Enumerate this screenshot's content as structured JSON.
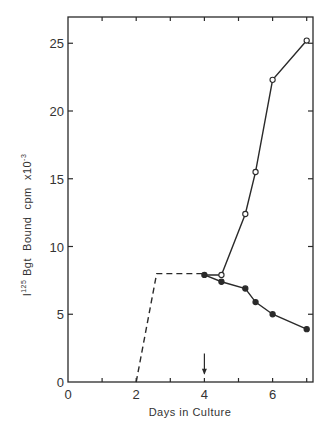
{
  "chart_data": {
    "type": "line",
    "title": "",
    "xlabel": "Days in Culture",
    "ylabel": "I125 Bgt Bound cpm x10-3",
    "ylabel_parts": {
      "prefix": "I",
      "sup1": "125",
      "main": " Bgt  Bound  cpm  x10",
      "sup2": "-3"
    },
    "xlim": [
      0,
      7.2
    ],
    "ylim": [
      0,
      27
    ],
    "x_ticks": [
      0,
      1,
      2,
      3,
      4,
      5,
      6,
      7
    ],
    "x_tick_labels": [
      {
        "value": 0,
        "label": "0"
      },
      {
        "value": 2,
        "label": "2"
      },
      {
        "value": 4,
        "label": "4"
      },
      {
        "value": 6,
        "label": "6"
      }
    ],
    "y_ticks": [
      0,
      5,
      10,
      15,
      20,
      25
    ],
    "y_tick_labels": [
      "0",
      "5",
      "10",
      "15",
      "20",
      "25"
    ],
    "grid": false,
    "legend": null,
    "series": [
      {
        "name": "dashed (pre-treatment)",
        "style": "dashed",
        "marker": "none",
        "points": [
          [
            2.0,
            0
          ],
          [
            2.6,
            8.0
          ],
          [
            4.0,
            8.0
          ]
        ]
      },
      {
        "name": "open circles",
        "style": "solid",
        "marker": "open-circle",
        "points": [
          [
            4.0,
            7.9
          ],
          [
            4.5,
            7.9
          ],
          [
            5.2,
            12.4
          ],
          [
            5.5,
            15.5
          ],
          [
            6.0,
            22.3
          ],
          [
            7.0,
            25.2
          ]
        ]
      },
      {
        "name": "filled circles",
        "style": "solid",
        "marker": "filled-circle",
        "points": [
          [
            4.0,
            7.9
          ],
          [
            4.5,
            7.4
          ],
          [
            5.2,
            6.9
          ],
          [
            5.5,
            5.9
          ],
          [
            6.0,
            5.0
          ],
          [
            7.0,
            3.9
          ]
        ]
      }
    ],
    "annotations": [
      {
        "type": "arrow-down",
        "x": 4.0,
        "y_from": 1.8,
        "y_to": 0.6
      }
    ]
  }
}
